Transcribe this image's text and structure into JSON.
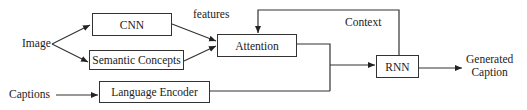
{
  "diagram": {
    "inputs": {
      "image": "Image",
      "captions": "Captions"
    },
    "nodes": {
      "cnn": "CNN",
      "semantic_concepts": "Semantic Concepts",
      "attention": "Attention",
      "language_encoder": "Language Encoder",
      "rnn": "RNN"
    },
    "edge_labels": {
      "features": "features",
      "context": "Context"
    },
    "output": {
      "line1": "Generated",
      "line2": "Caption"
    },
    "edges": [
      [
        "Image",
        "CNN"
      ],
      [
        "Image",
        "Semantic Concepts"
      ],
      [
        "CNN",
        "Attention"
      ],
      [
        "Semantic Concepts",
        "Attention"
      ],
      [
        "Captions",
        "Language Encoder"
      ],
      [
        "Attention",
        "RNN"
      ],
      [
        "Language Encoder",
        "RNN"
      ],
      [
        "RNN",
        "Attention (Context)"
      ],
      [
        "RNN",
        "Generated Caption"
      ]
    ]
  }
}
